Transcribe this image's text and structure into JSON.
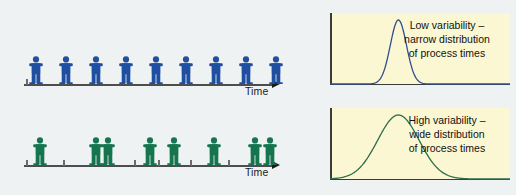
{
  "figure": {
    "background_color": "#eff2f3"
  },
  "chart_data": {
    "type": "line",
    "panels": [
      {
        "id": "low-variability",
        "caption_lines": [
          "Low variability –",
          "narrow distribution",
          "of process times"
        ],
        "curve_color": "#2f4f8f",
        "panel_background": "#fbf7d2",
        "distribution": "normal",
        "mean": 0.38,
        "stddev": 0.045,
        "xlabel": "",
        "ylabel": "",
        "grid": false
      },
      {
        "id": "high-variability",
        "caption_lines": [
          "High variability –",
          "wide distribution",
          "of process times"
        ],
        "curve_color": "#2e6b4f",
        "panel_background": "#fbf7d2",
        "distribution": "normal",
        "mean": 0.38,
        "stddev": 0.115,
        "xlabel": "",
        "ylabel": "",
        "grid": false
      }
    ]
  },
  "timelines": [
    {
      "id": "low-variability-timeline",
      "axis_label": "Time",
      "figure_color": "#1f4fa0",
      "arrival_positions": [
        28,
        58,
        88,
        118,
        148,
        178,
        208,
        238,
        268
      ],
      "tick_positions": [
        26
      ],
      "description": "Evenly spaced arrivals – low variability"
    },
    {
      "id": "high-variability-timeline",
      "axis_label": "Time",
      "figure_color": "#14754f",
      "arrival_positions": [
        32,
        88,
        100,
        142,
        166,
        206,
        247,
        262
      ],
      "tick_positions": [
        26,
        63,
        134,
        158,
        190,
        228
      ],
      "description": "Irregularly spaced arrivals – high variability"
    }
  ]
}
